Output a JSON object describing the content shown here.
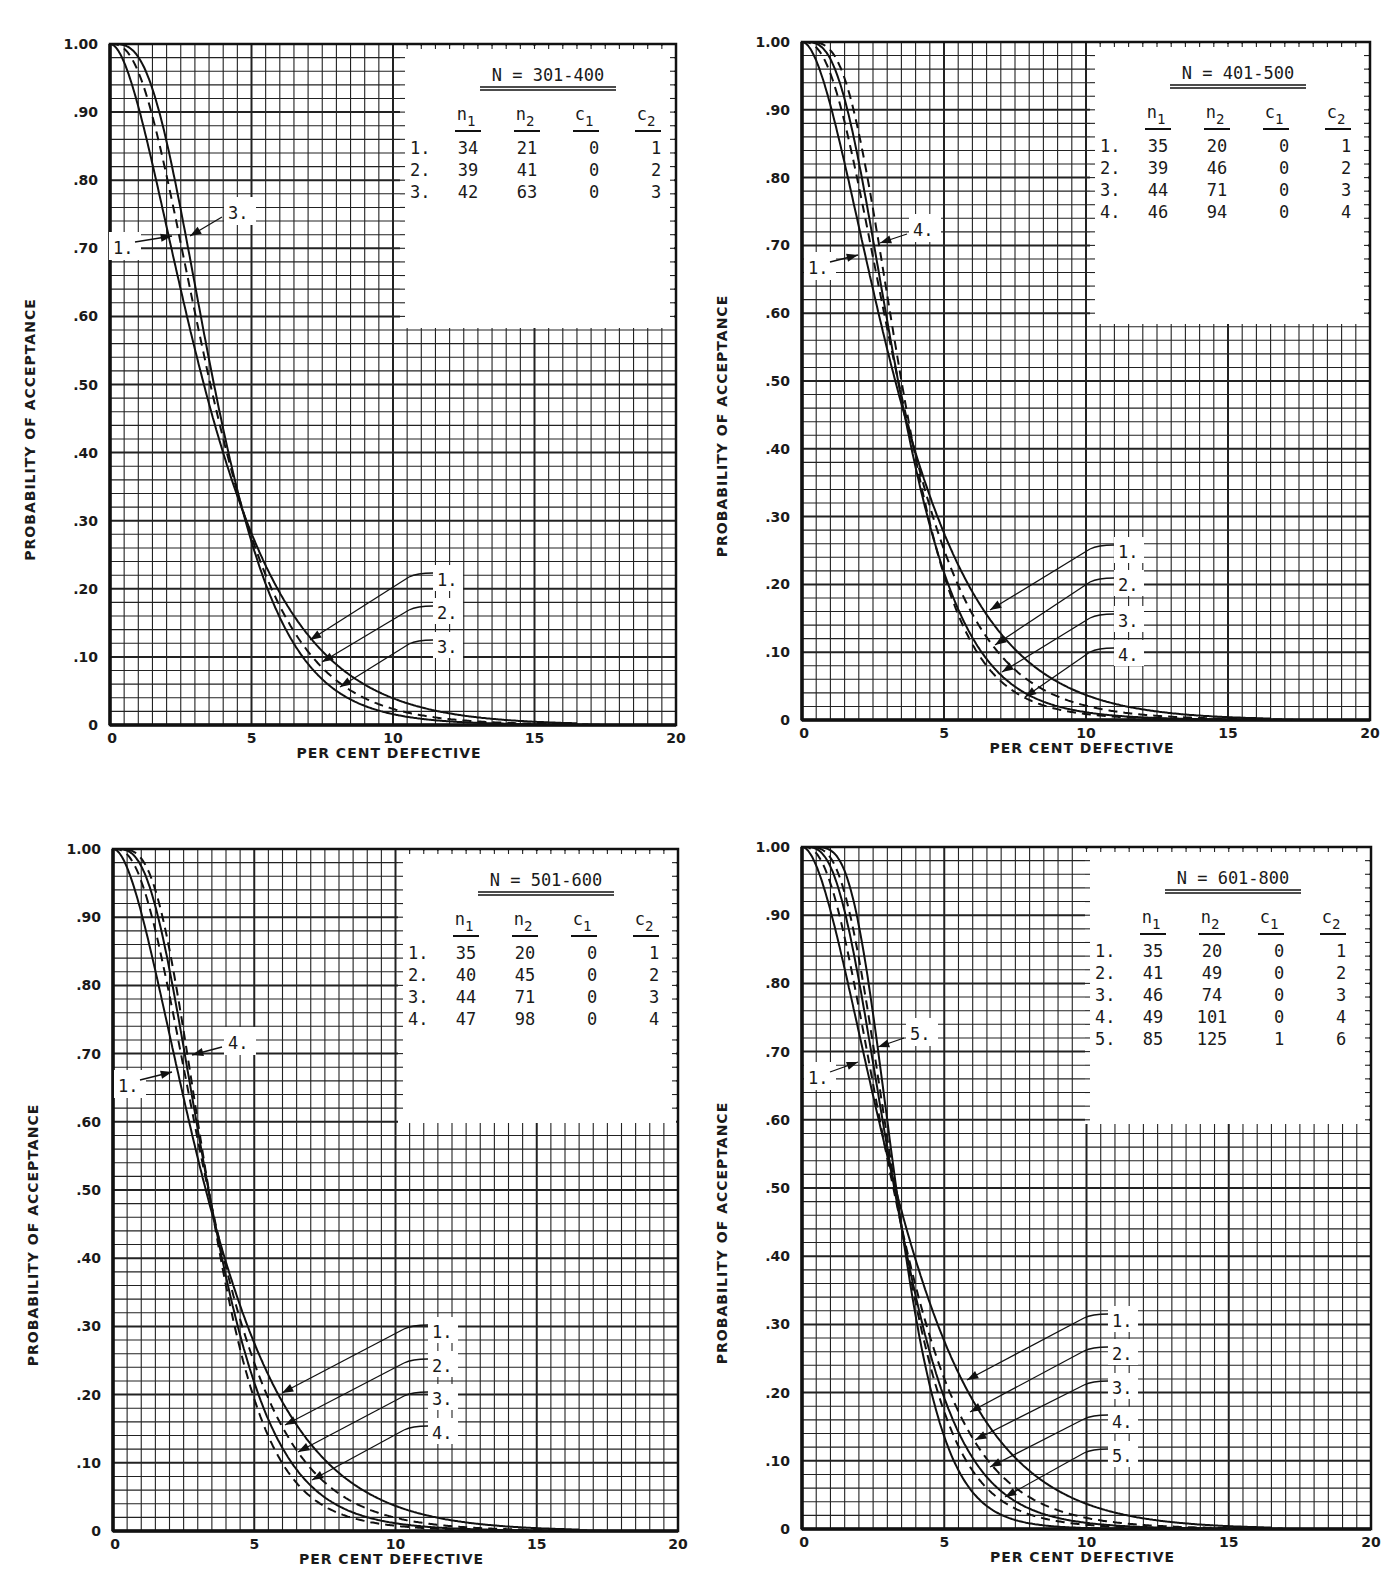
{
  "axes": {
    "x_label": "PER CENT DEFECTIVE",
    "y_label": "PROBABILITY OF ACCEPTANCE",
    "x_ticks": [
      "0",
      "5",
      "10",
      "15",
      "20"
    ],
    "y_ticks": [
      "0",
      ".10",
      ".20",
      ".30",
      ".40",
      ".50",
      ".60",
      ".70",
      ".80",
      ".90",
      "1.00"
    ]
  },
  "panels": [
    {
      "id": "N301-400",
      "title": "N = 301-400",
      "box": {
        "x0": 110,
        "x20": 676,
        "ytop": 44,
        "ybot": 725
      },
      "table_box": {
        "x": 400,
        "y": 44,
        "w": 276,
        "h": 282
      },
      "headers": [
        "n1",
        "n2",
        "c1",
        "c2"
      ],
      "plans": [
        {
          "label": "1.",
          "n1": "34",
          "n2": "21",
          "c1": "0",
          "c2": "1",
          "dashed": false
        },
        {
          "label": "2.",
          "n1": "39",
          "n2": "41",
          "c1": "0",
          "c2": "2",
          "dashed": true
        },
        {
          "label": "3.",
          "n1": "42",
          "n2": "63",
          "c1": "0",
          "c2": "3",
          "dashed": false
        }
      ],
      "top_labels": [
        {
          "text": "1.",
          "x": 113,
          "y": 250,
          "tx": 172,
          "ty": 236
        },
        {
          "text": "3.",
          "x": 228,
          "y": 215,
          "tx": 190,
          "ty": 236
        }
      ],
      "bottom_labels": [
        {
          "text": "1.",
          "lx": 437,
          "ly": 579,
          "tx": 310,
          "ty": 640
        },
        {
          "text": "2.",
          "lx": 437,
          "ly": 612,
          "tx": 322,
          "ty": 662
        },
        {
          "text": "3.",
          "lx": 437,
          "ly": 646,
          "tx": 340,
          "ty": 687
        }
      ]
    },
    {
      "id": "N401-500",
      "title": "N = 401-500",
      "box": {
        "x0": 802,
        "x20": 1370,
        "ytop": 42,
        "ybot": 720
      },
      "table_box": {
        "x": 1090,
        "y": 42,
        "w": 280,
        "h": 280
      },
      "headers": [
        "n1",
        "n2",
        "c1",
        "c2"
      ],
      "plans": [
        {
          "label": "1.",
          "n1": "35",
          "n2": "20",
          "c1": "0",
          "c2": "1",
          "dashed": false
        },
        {
          "label": "2.",
          "n1": "39",
          "n2": "46",
          "c1": "0",
          "c2": "2",
          "dashed": true
        },
        {
          "label": "3.",
          "n1": "44",
          "n2": "71",
          "c1": "0",
          "c2": "3",
          "dashed": false
        },
        {
          "label": "4.",
          "n1": "46",
          "n2": "94",
          "c1": "0",
          "c2": "4",
          "dashed": true
        }
      ],
      "top_labels": [
        {
          "text": "1.",
          "x": 808,
          "y": 270,
          "tx": 858,
          "ty": 255
        },
        {
          "text": "4.",
          "x": 913,
          "y": 232,
          "tx": 880,
          "ty": 243
        }
      ],
      "bottom_labels": [
        {
          "text": "1.",
          "lx": 1118,
          "ly": 551,
          "tx": 990,
          "ty": 610
        },
        {
          "text": "2.",
          "lx": 1118,
          "ly": 584,
          "tx": 995,
          "ty": 645
        },
        {
          "text": "3.",
          "lx": 1118,
          "ly": 620,
          "tx": 1002,
          "ty": 672
        },
        {
          "text": "4.",
          "lx": 1118,
          "ly": 654,
          "tx": 1025,
          "ty": 697
        }
      ]
    },
    {
      "id": "N501-600",
      "title": "N = 501-600",
      "box": {
        "x0": 113,
        "x20": 678,
        "ytop": 849,
        "ybot": 1531
      },
      "table_box": {
        "x": 398,
        "y": 849,
        "w": 280,
        "h": 272
      },
      "headers": [
        "n1",
        "n2",
        "c1",
        "c2"
      ],
      "plans": [
        {
          "label": "1.",
          "n1": "35",
          "n2": "20",
          "c1": "0",
          "c2": "1",
          "dashed": false
        },
        {
          "label": "2.",
          "n1": "40",
          "n2": "45",
          "c1": "0",
          "c2": "2",
          "dashed": true
        },
        {
          "label": "3.",
          "n1": "44",
          "n2": "71",
          "c1": "0",
          "c2": "3",
          "dashed": false
        },
        {
          "label": "4.",
          "n1": "47",
          "n2": "98",
          "c1": "0",
          "c2": "4",
          "dashed": true
        }
      ],
      "top_labels": [
        {
          "text": "1.",
          "x": 118,
          "y": 1088,
          "tx": 172,
          "ty": 1072
        },
        {
          "text": "4.",
          "x": 228,
          "y": 1045,
          "tx": 192,
          "ty": 1055
        }
      ],
      "bottom_labels": [
        {
          "text": "1.",
          "lx": 432,
          "ly": 1331,
          "tx": 282,
          "ty": 1393
        },
        {
          "text": "2.",
          "lx": 432,
          "ly": 1365,
          "tx": 285,
          "ty": 1425
        },
        {
          "text": "3.",
          "lx": 432,
          "ly": 1398,
          "tx": 298,
          "ty": 1452
        },
        {
          "text": "4.",
          "lx": 432,
          "ly": 1432,
          "tx": 312,
          "ty": 1480
        }
      ]
    },
    {
      "id": "N601-800",
      "title": "N = 601-800",
      "box": {
        "x0": 802,
        "x20": 1371,
        "ytop": 847,
        "ybot": 1529
      },
      "table_box": {
        "x": 1085,
        "y": 847,
        "w": 286,
        "h": 275
      },
      "headers": [
        "n1",
        "n2",
        "c1",
        "c2"
      ],
      "plans": [
        {
          "label": "1.",
          "n1": "35",
          "n2": "20",
          "c1": "0",
          "c2": "1",
          "dashed": false
        },
        {
          "label": "2.",
          "n1": "41",
          "n2": "49",
          "c1": "0",
          "c2": "2",
          "dashed": true
        },
        {
          "label": "3.",
          "n1": "46",
          "n2": "74",
          "c1": "0",
          "c2": "3",
          "dashed": false
        },
        {
          "label": "4.",
          "n1": "49",
          "n2": "101",
          "c1": "0",
          "c2": "4",
          "dashed": true
        },
        {
          "label": "5.",
          "n1": "85",
          "n2": "125",
          "c1": "1",
          "c2": "6",
          "dashed": false
        }
      ],
      "top_labels": [
        {
          "text": "1.",
          "x": 808,
          "y": 1080,
          "tx": 858,
          "ty": 1062
        },
        {
          "text": "5.",
          "x": 910,
          "y": 1036,
          "tx": 878,
          "ty": 1047
        }
      ],
      "bottom_labels": [
        {
          "text": "1.",
          "lx": 1112,
          "ly": 1320,
          "tx": 967,
          "ty": 1380
        },
        {
          "text": "2.",
          "lx": 1112,
          "ly": 1353,
          "tx": 970,
          "ty": 1412
        },
        {
          "text": "3.",
          "lx": 1112,
          "ly": 1387,
          "tx": 975,
          "ty": 1440
        },
        {
          "text": "4.",
          "lx": 1112,
          "ly": 1421,
          "tx": 990,
          "ty": 1467
        },
        {
          "text": "5.",
          "lx": 1112,
          "ly": 1455,
          "tx": 1005,
          "ty": 1497
        }
      ]
    }
  ],
  "chart_data": [
    {
      "type": "line",
      "title": "N = 301-400",
      "xlabel": "PER CENT DEFECTIVE",
      "ylabel": "PROBABILITY OF ACCEPTANCE",
      "xlim": [
        0,
        20
      ],
      "ylim": [
        0,
        1.0
      ],
      "grid": true,
      "x": [
        0,
        1,
        2,
        3,
        4,
        5,
        6,
        7,
        8,
        10,
        12,
        15,
        20
      ],
      "series": [
        {
          "name": "1. n1=34 n2=21 c1=0 c2=1",
          "values": [
            1.0,
            0.93,
            0.76,
            0.57,
            0.41,
            0.28,
            0.19,
            0.13,
            0.08,
            0.03,
            0.01,
            0.0,
            0.0
          ]
        },
        {
          "name": "2. n1=39 n2=41 c1=0 c2=2",
          "values": [
            1.0,
            0.96,
            0.8,
            0.59,
            0.4,
            0.27,
            0.16,
            0.1,
            0.06,
            0.02,
            0.01,
            0.0,
            0.0
          ]
        },
        {
          "name": "3. n1=42 n2=63 c1=0 c2=3",
          "values": [
            1.0,
            0.98,
            0.84,
            0.61,
            0.4,
            0.26,
            0.14,
            0.08,
            0.04,
            0.01,
            0.0,
            0.0,
            0.0
          ]
        }
      ]
    },
    {
      "type": "line",
      "title": "N = 401-500",
      "xlabel": "PER CENT DEFECTIVE",
      "ylabel": "PROBABILITY OF ACCEPTANCE",
      "xlim": [
        0,
        20
      ],
      "ylim": [
        0,
        1.0
      ],
      "grid": true,
      "x": [
        0,
        1,
        2,
        3,
        4,
        5,
        6,
        7,
        8,
        10,
        12,
        15,
        20
      ],
      "series": [
        {
          "name": "1. n1=35 n2=20 c1=0 c2=1",
          "values": [
            1.0,
            0.93,
            0.75,
            0.56,
            0.4,
            0.27,
            0.18,
            0.12,
            0.07,
            0.03,
            0.01,
            0.0,
            0.0
          ]
        },
        {
          "name": "2. n1=39 n2=46 c1=0 c2=2",
          "values": [
            1.0,
            0.96,
            0.8,
            0.58,
            0.39,
            0.25,
            0.15,
            0.09,
            0.05,
            0.02,
            0.0,
            0.0,
            0.0
          ]
        },
        {
          "name": "3. n1=44 n2=71 c1=0 c2=3",
          "values": [
            1.0,
            0.98,
            0.83,
            0.6,
            0.38,
            0.22,
            0.12,
            0.06,
            0.03,
            0.01,
            0.0,
            0.0,
            0.0
          ]
        },
        {
          "name": "4. n1=46 n2=94 c1=0 c2=4",
          "values": [
            1.0,
            0.99,
            0.86,
            0.61,
            0.38,
            0.21,
            0.1,
            0.05,
            0.02,
            0.0,
            0.0,
            0.0,
            0.0
          ]
        }
      ]
    },
    {
      "type": "line",
      "title": "N = 501-600",
      "xlabel": "PER CENT DEFECTIVE",
      "ylabel": "PROBABILITY OF ACCEPTANCE",
      "xlim": [
        0,
        20
      ],
      "ylim": [
        0,
        1.0
      ],
      "grid": true,
      "x": [
        0,
        1,
        2,
        3,
        4,
        5,
        6,
        7,
        8,
        10,
        12,
        15,
        20
      ],
      "series": [
        {
          "name": "1. n1=35 n2=20 c1=0 c2=1",
          "values": [
            1.0,
            0.93,
            0.75,
            0.56,
            0.4,
            0.27,
            0.18,
            0.12,
            0.07,
            0.03,
            0.01,
            0.0,
            0.0
          ]
        },
        {
          "name": "2. n1=40 n2=45 c1=0 c2=2",
          "values": [
            1.0,
            0.96,
            0.8,
            0.58,
            0.39,
            0.24,
            0.15,
            0.09,
            0.05,
            0.02,
            0.0,
            0.0,
            0.0
          ]
        },
        {
          "name": "3. n1=44 n2=71 c1=0 c2=3",
          "values": [
            1.0,
            0.98,
            0.83,
            0.6,
            0.38,
            0.22,
            0.12,
            0.06,
            0.03,
            0.01,
            0.0,
            0.0,
            0.0
          ]
        },
        {
          "name": "4. n1=47 n2=98 c1=0 c2=4",
          "values": [
            1.0,
            0.99,
            0.86,
            0.61,
            0.37,
            0.2,
            0.1,
            0.04,
            0.02,
            0.0,
            0.0,
            0.0,
            0.0
          ]
        }
      ]
    },
    {
      "type": "line",
      "title": "N = 601-800",
      "xlabel": "PER CENT DEFECTIVE",
      "ylabel": "PROBABILITY OF ACCEPTANCE",
      "xlim": [
        0,
        20
      ],
      "ylim": [
        0,
        1.0
      ],
      "grid": true,
      "x": [
        0,
        1,
        2,
        3,
        4,
        5,
        6,
        7,
        8,
        10,
        12,
        15,
        20
      ],
      "series": [
        {
          "name": "1. n1=35 n2=20 c1=0 c2=1",
          "values": [
            1.0,
            0.93,
            0.75,
            0.56,
            0.4,
            0.27,
            0.18,
            0.12,
            0.07,
            0.03,
            0.01,
            0.0,
            0.0
          ]
        },
        {
          "name": "2. n1=41 n2=49 c1=0 c2=2",
          "values": [
            1.0,
            0.96,
            0.8,
            0.58,
            0.38,
            0.24,
            0.14,
            0.08,
            0.05,
            0.01,
            0.0,
            0.0,
            0.0
          ]
        },
        {
          "name": "3. n1=46 n2=74 c1=0 c2=3",
          "values": [
            1.0,
            0.98,
            0.83,
            0.59,
            0.37,
            0.21,
            0.11,
            0.06,
            0.03,
            0.01,
            0.0,
            0.0,
            0.0
          ]
        },
        {
          "name": "4. n1=49 n2=101 c1=0 c2=4",
          "values": [
            1.0,
            0.99,
            0.86,
            0.6,
            0.36,
            0.19,
            0.09,
            0.04,
            0.02,
            0.0,
            0.0,
            0.0,
            0.0
          ]
        },
        {
          "name": "5. n1=85 n2=125 c1=1 c2=6",
          "values": [
            1.0,
            1.0,
            0.89,
            0.61,
            0.33,
            0.15,
            0.06,
            0.02,
            0.01,
            0.0,
            0.0,
            0.0,
            0.0
          ]
        }
      ]
    }
  ]
}
